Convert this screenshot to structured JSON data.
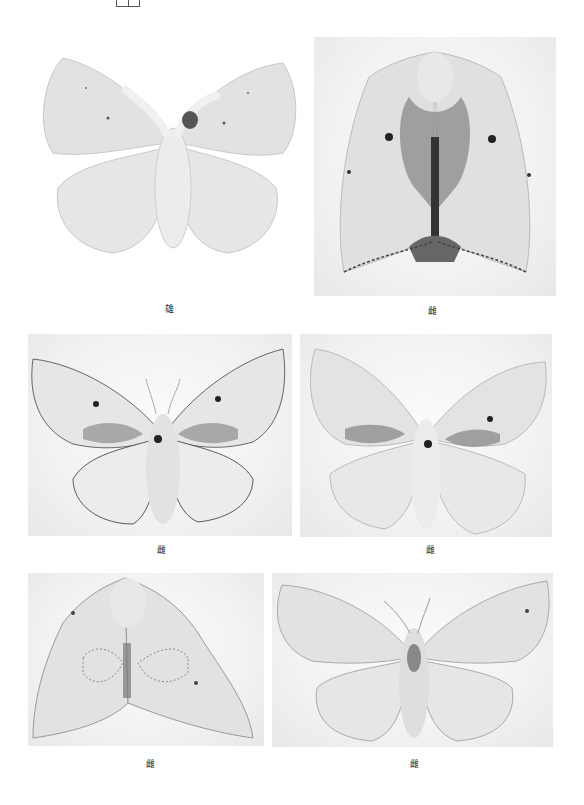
{
  "header": {
    "icon": "page-layout-icon"
  },
  "plates": [
    {
      "id": "specimen-1",
      "caption": "雄",
      "view": "dorsal-spread"
    },
    {
      "id": "specimen-2",
      "caption": "雌",
      "view": "dorsal-folded"
    },
    {
      "id": "specimen-3",
      "caption": "雌",
      "view": "dorsal-spread"
    },
    {
      "id": "specimen-4",
      "caption": "雌",
      "view": "dorsal-spread"
    },
    {
      "id": "specimen-5",
      "caption": "雌",
      "view": "dorsal-folded"
    },
    {
      "id": "specimen-6",
      "caption": "雌",
      "view": "dorsal-spread"
    }
  ],
  "colors": {
    "background": "#ffffff",
    "wing": "#e4e4e4",
    "wing_shade": "#cfcfcf",
    "body": "#dcdcdc",
    "dark_mark": "#3a3a3a",
    "edge": "#555555"
  }
}
